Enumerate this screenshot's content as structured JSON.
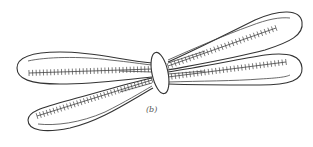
{
  "figure": {
    "label": "(b)",
    "parts": {
      "arms": [
        "left-upper-arm",
        "left-lower-arm",
        "right-upper-arm",
        "right-lower-arm"
      ],
      "centromere": "centromere"
    }
  }
}
